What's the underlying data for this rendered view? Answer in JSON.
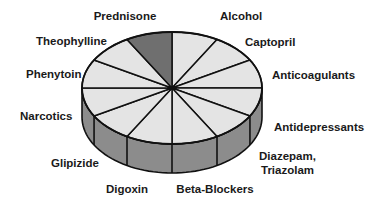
{
  "chart_data": {
    "type": "pie",
    "style": "3d-disc",
    "title": "",
    "direction": "clockwise-from-top",
    "slices": [
      {
        "label": "Alcohol",
        "value": 1,
        "highlighted": false
      },
      {
        "label": "Captopril",
        "value": 1,
        "highlighted": false
      },
      {
        "label": "Anticoagulants",
        "value": 1,
        "highlighted": false
      },
      {
        "label": "Antidepressants",
        "value": 1,
        "highlighted": false
      },
      {
        "label": "Diazepam, Triazolam",
        "lines": [
          "Diazepam,",
          "Triazolam"
        ],
        "value": 1,
        "highlighted": false
      },
      {
        "label": "Beta-Blockers",
        "value": 1,
        "highlighted": false
      },
      {
        "label": "Digoxin",
        "value": 1,
        "highlighted": false
      },
      {
        "label": "Glipizide",
        "value": 1,
        "highlighted": false
      },
      {
        "label": "Narcotics",
        "value": 1,
        "highlighted": false
      },
      {
        "label": "Phenytoin",
        "value": 1,
        "highlighted": false
      },
      {
        "label": "Theophylline",
        "value": 1,
        "highlighted": false
      },
      {
        "label": "Prednisone",
        "value": 1,
        "highlighted": true
      }
    ],
    "colors": {
      "slice": "#e4e4e4",
      "highlight": "#6f6f6f",
      "rim": "#8c8c8c",
      "outline": "#111111"
    },
    "legend": "none"
  }
}
